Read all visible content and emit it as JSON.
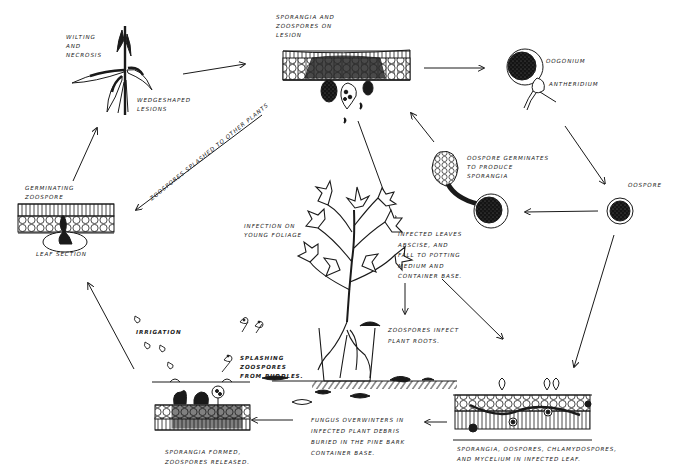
{
  "diagram": {
    "type": "disease-cycle",
    "stroke_color": "#1a1a1a",
    "background": "#ffffff"
  },
  "labels": {
    "wilting": "WILTING\nAND\nNECROSIS",
    "wedge_lesions": "WEDGESHAPED\nLESIONS",
    "sporangia_lesion": "SPORANGIA AND\nZOOSPORES ON\nLESION",
    "oogonium": "OOGONIUM",
    "antheridium": "ANTHERIDIUM",
    "oospore_germinates": "OOSPORE GERMINATES\nTO PRODUCE\nSPORANGIA",
    "oospore": "OOSPORE",
    "germinating_zoospore": "GERMINATING\nZOOSPORE",
    "leaf_section": "LEAF SECTION",
    "zoospores_splashed": "ZOOSPORES SPLASHED TO OTHER PLANTS",
    "infection_young": "INFECTION ON\nYOUNG FOLIAGE",
    "infected_leaves": "INFECTED LEAVES\nABSCISE, AND\nFALL TO POTTING\nMEDIUM AND\nCONTAINER BASE.",
    "zoospores_infect_roots": "ZOOSPORES INFECT\nPLANT ROOTS.",
    "irrigation": "IRRIGATION",
    "splashing": "SPLASHING\nZOOSPORES\nFROM PUDDLES.",
    "sporangia_formed": "SPORANGIA FORMED,\nZOOSPORES RELEASED.",
    "fungus_overwinters": "FUNGUS OVERWINTERS IN\nINFECTED PLANT DEBRIS\nBURIED IN THE PINE BARK\nCONTAINER BASE.",
    "infected_leaf_bottom": "SPORANGIA, OOSPORES, CHLAMYDOSPORES,\nAND MYCELIUM IN INFECTED LEAF."
  },
  "stages": [
    {
      "id": "wilting-plant",
      "label": "Wilting and necrosis"
    },
    {
      "id": "lesion-section",
      "label": "Sporangia and zoospores on lesion"
    },
    {
      "id": "oogonium",
      "label": "Oogonium and antheridium"
    },
    {
      "id": "oospore",
      "label": "Oospore"
    },
    {
      "id": "germinating-oospore",
      "label": "Oospore germinates to produce sporangia"
    },
    {
      "id": "infected-leaf",
      "label": "Sporangia, oospores, chlamydospores, and mycelium in infected leaf"
    },
    {
      "id": "debris",
      "label": "Fungus overwinters in infected plant debris"
    },
    {
      "id": "splash-section",
      "label": "Sporangia formed, zoospores released"
    },
    {
      "id": "leaf-section",
      "label": "Germinating zoospore"
    },
    {
      "id": "potted-plant",
      "label": "Infection on young foliage"
    }
  ]
}
